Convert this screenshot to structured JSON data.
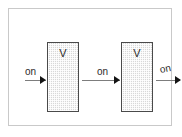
{
  "diagram": {
    "frame": {
      "border_color": "#c9c9c9",
      "background_color": "#ffffff"
    },
    "states": [
      {
        "id": "state-1",
        "label": "V",
        "fill_color": "#d8d8d8",
        "border_color": "#4a4a4a",
        "fill_pattern": "stipple"
      },
      {
        "id": "state-2",
        "label": "V",
        "fill_color": "#d8d8d8",
        "border_color": "#4a4a4a",
        "fill_pattern": "stipple"
      }
    ],
    "transitions": [
      {
        "id": "transition-in",
        "label": "on",
        "direction": "right",
        "line_color": "#7d7d7d",
        "head_color": "#141414"
      },
      {
        "id": "transition-mid",
        "label": "on",
        "direction": "right",
        "line_color": "#7d7d7d",
        "head_color": "#141414"
      },
      {
        "id": "transition-out",
        "label": "on",
        "direction": "right",
        "line_color": "#7d7d7d",
        "head_color": "#141414"
      }
    ]
  }
}
